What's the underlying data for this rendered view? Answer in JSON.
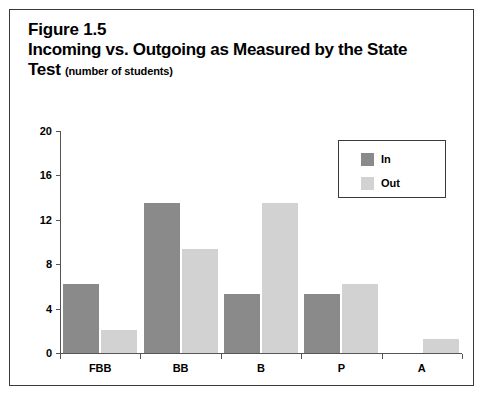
{
  "figure": {
    "number": "Figure 1.5",
    "title": "Incoming vs. Outgoing as Measured by the State",
    "title_line2": "Test",
    "subtitle": "(number of students)"
  },
  "legend": {
    "position": "top-right",
    "entries": [
      {
        "label": "In",
        "color": "#8a8a8a"
      },
      {
        "label": "Out",
        "color": "#d2d2d2"
      }
    ]
  },
  "axis": {
    "y_ticks": [
      "20",
      "16",
      "12",
      "8",
      "4",
      "0"
    ],
    "x_ticks": [
      "FBB",
      "BB",
      "B",
      "P",
      "A"
    ]
  },
  "chart_data": {
    "type": "bar",
    "title": "Figure 1.5 Incoming vs. Outgoing as Measured by the State Test (number of students)",
    "xlabel": "",
    "ylabel": "",
    "ylim": [
      0,
      20
    ],
    "ytick_values": [
      0,
      4,
      8,
      12,
      16,
      20
    ],
    "grid": false,
    "legend_position": "top-right",
    "categories": [
      "FBB",
      "BB",
      "B",
      "P",
      "A"
    ],
    "series": [
      {
        "name": "In",
        "color": "#8a8a8a",
        "values": [
          6.2,
          13.5,
          5.3,
          5.3,
          0
        ]
      },
      {
        "name": "Out",
        "color": "#d2d2d2",
        "values": [
          2.1,
          9.4,
          13.5,
          6.2,
          1.3
        ]
      }
    ]
  }
}
